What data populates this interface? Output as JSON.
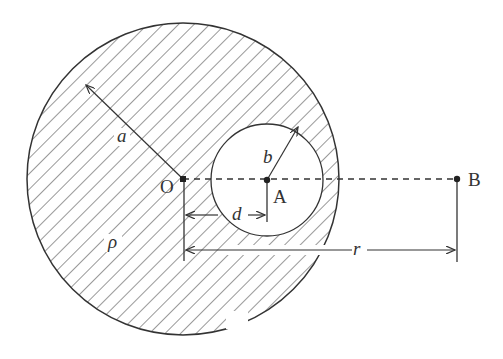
{
  "figure": {
    "labels": {
      "outer_radius": "a",
      "inner_radius": "b",
      "density": "ρ",
      "center_O": "O",
      "center_A": "A",
      "point_B": "B",
      "offset": "d",
      "distance": "r"
    },
    "colors": {
      "stroke": "#333333",
      "background": "#ffffff"
    }
  }
}
